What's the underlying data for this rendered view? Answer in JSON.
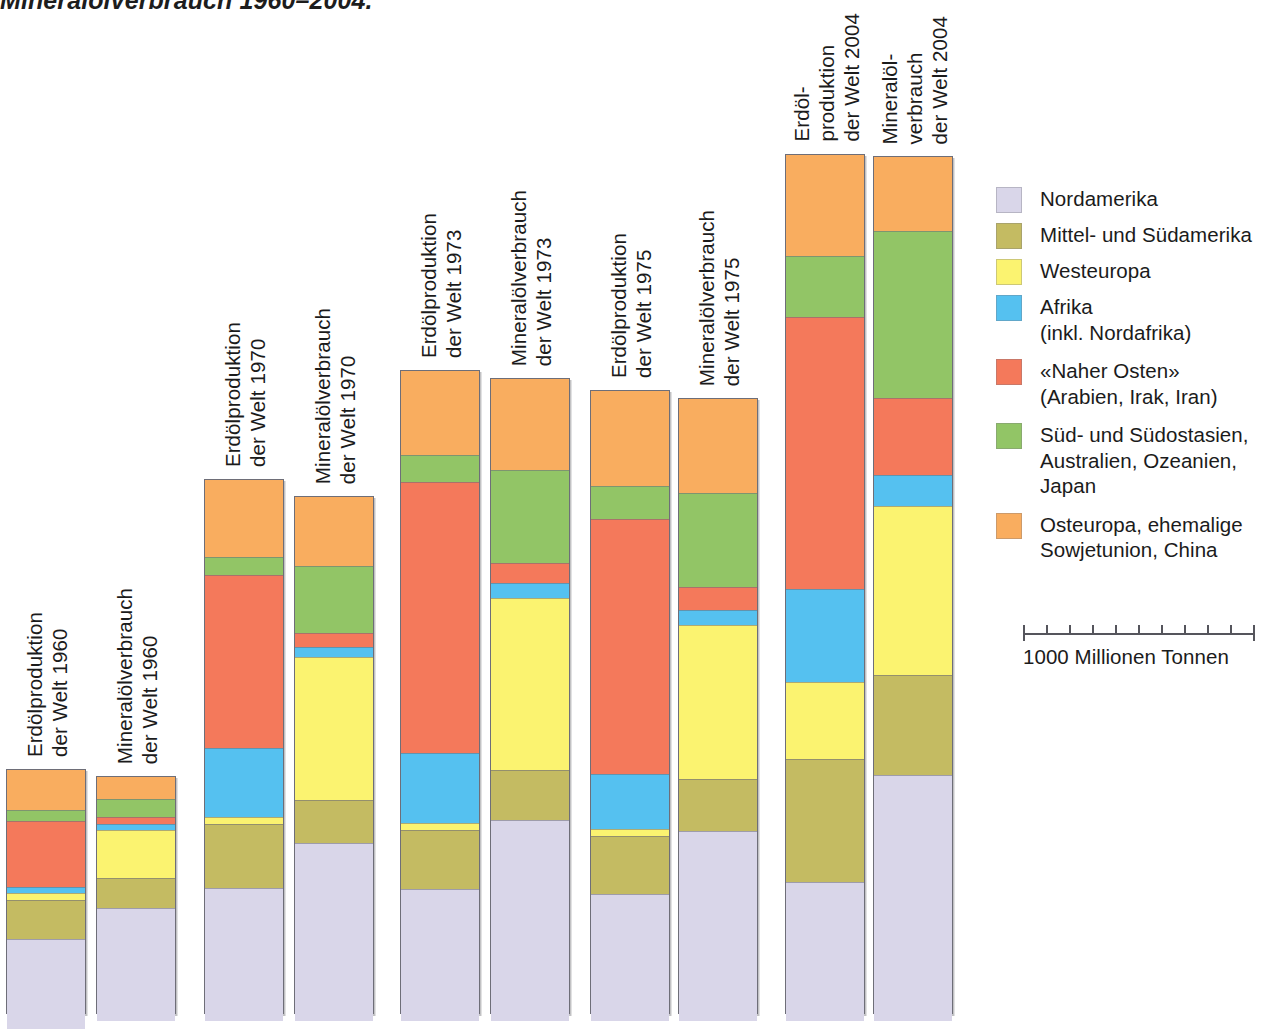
{
  "figure": {
    "title": "Mineralölverbrauch 1960–2004.",
    "title_visible_fragment": "Mineralölverbrauch 1960–2004."
  },
  "legend": {
    "items": [
      {
        "label": "Nordamerika",
        "color": "#d9d6e9",
        "key": "nordamerika"
      },
      {
        "label": "Mittel- und Südamerika",
        "color": "#c4bb62",
        "key": "mittel-suedamerika"
      },
      {
        "label": "Westeuropa",
        "color": "#fbf370",
        "key": "westeuropa"
      },
      {
        "label": "Afrika\n(inkl. Nordafrika)",
        "color": "#55c1f0",
        "key": "afrika"
      },
      {
        "label": "«Naher Osten»\n(Arabien, Irak, Iran)",
        "color": "#f4795b",
        "key": "naher-osten"
      },
      {
        "label": "Süd- und Südostasien,\nAustralien, Ozeanien,\nJapan",
        "color": "#92c566",
        "key": "suedasien"
      },
      {
        "label": "Osteuropa, ehemalige\nSowjetunion, China",
        "color": "#f9ad5f",
        "key": "osteuropa"
      }
    ]
  },
  "scale": {
    "label": "1000 Millionen Tonnen",
    "value": 1000,
    "unit": "Millionen Tonnen",
    "tick_count": 10
  },
  "chart_data": {
    "type": "bar",
    "subtype": "stacked-column",
    "xlabel": "",
    "ylabel": "Millionen Tonnen",
    "unit": "Millionen Tonnen",
    "scale_reference": {
      "pixels": 230,
      "value": 1000
    },
    "grid": false,
    "legend_position": "right",
    "series": [
      {
        "name": "Nordamerika",
        "color": "#d9d6e9"
      },
      {
        "name": "Mittel- und Südamerika",
        "color": "#c4bb62"
      },
      {
        "name": "Westeuropa",
        "color": "#fbf370"
      },
      {
        "name": "Afrika (inkl. Nordafrika)",
        "color": "#55c1f0"
      },
      {
        "name": "«Naher Osten» (Arabien, Irak, Iran)",
        "color": "#f4795b"
      },
      {
        "name": "Süd- und Südostasien, Australien, Ozeanien, Japan",
        "color": "#92c566"
      },
      {
        "name": "Osteuropa, ehemalige Sowjetunion, China",
        "color": "#f9ad5f"
      }
    ],
    "categories": [
      "Erdölproduktion der Welt 1960",
      "Mineralölverbrauch der Welt 1960",
      "Erdölproduktion der Welt 1970",
      "Mineralölverbrauch der Welt 1970",
      "Erdölproduktion der Welt 1973",
      "Mineralölverbrauch der Welt 1973",
      "Erdölproduktion der Welt 1975",
      "Mineralölverbrauch der Welt 1975",
      "Erdölproduktion der Welt 2004",
      "Mineralölverbrauch der Welt 2004"
    ],
    "bars": [
      {
        "id": "prod-1960",
        "label_lines": [
          "Erdölproduktion",
          "der Welt 1960"
        ],
        "year": 1960,
        "kind": "Erdölproduktion",
        "total": 1065,
        "values": {
          "Nordamerika": 387,
          "Mittel- und Südamerika": 165,
          "Westeuropa": 26,
          "Afrika (inkl. Nordafrika)": 22,
          "«Naher Osten» (Arabien, Irak, Iran)": 282,
          "Süd- und Südostasien, Australien, Ozeanien, Japan": 43,
          "Osteuropa, ehemalige Sowjetunion, China": 174
        }
      },
      {
        "id": "cons-1960",
        "label_lines": [
          "Mineralölverbrauch",
          "der Welt 1960"
        ],
        "year": 1960,
        "kind": "Mineralölverbrauch",
        "total": 1035,
        "values": {
          "Nordamerika": 487,
          "Mittel- und Südamerika": 126,
          "Westeuropa": 204,
          "Afrika (inkl. Nordafrika)": 22,
          "«Naher Osten» (Arabien, Irak, Iran)": 26,
          "Süd- und Südostasien, Australien, Ozeanien, Japan": 74,
          "Osteuropa, ehemalige Sowjetunion, China": 96
        }
      },
      {
        "id": "prod-1970",
        "label_lines": [
          "Erdölproduktion",
          "der Welt 1970"
        ],
        "year": 1970,
        "kind": "Erdölproduktion",
        "total": 2326,
        "values": {
          "Nordamerika": 574,
          "Mittel- und Südamerika": 274,
          "Westeuropa": 26,
          "Afrika (inkl. Nordafrika)": 296,
          "«Naher Osten» (Arabien, Irak, Iran)": 748,
          "Süd- und Südostasien, Australien, Ozeanien, Japan": 74,
          "Osteuropa, ehemalige Sowjetunion, China": 334
        }
      },
      {
        "id": "cons-1970",
        "label_lines": [
          "Mineralölverbrauch",
          "der Welt 1970"
        ],
        "year": 1970,
        "kind": "Mineralölverbrauch",
        "total": 2252,
        "values": {
          "Nordamerika": 770,
          "Mittel- und Südamerika": 183,
          "Westeuropa": 617,
          "Afrika (inkl. Nordafrika)": 39,
          "«Naher Osten» (Arabien, Irak, Iran)": 57,
          "Süd- und Südostasien, Australien, Ozeanien, Japan": 287,
          "Osteuropa, ehemalige Sowjetunion, China": 300
        }
      },
      {
        "id": "prod-1973",
        "label_lines": [
          "Erdölproduktion",
          "der Welt 1973"
        ],
        "year": 1973,
        "kind": "Erdölproduktion",
        "total": 2800,
        "values": {
          "Nordamerika": 570,
          "Mittel- und Südamerika": 252,
          "Westeuropa": 26,
          "Afrika (inkl. Nordafrika)": 300,
          "«Naher Osten» (Arabien, Irak, Iran)": 1174,
          "Süd- und Südostasien, Australien, Ozeanien, Japan": 113,
          "Osteuropa, ehemalige Sowjetunion, China": 365
        }
      },
      {
        "id": "cons-1973",
        "label_lines": [
          "Mineralölverbrauch",
          "der Welt 1973"
        ],
        "year": 1973,
        "kind": "Mineralölverbrauch",
        "total": 2765,
        "values": {
          "Nordamerika": 870,
          "Mittel- und Südamerika": 213,
          "Westeuropa": 743,
          "Afrika (inkl. Nordafrika)": 61,
          "«Naher Osten» (Arabien, Irak, Iran)": 83,
          "Süd- und Südostasien, Australien, Ozeanien, Japan": 400,
          "Osteuropa, ehemalige Sowjetunion, China": 395
        }
      },
      {
        "id": "prod-1975",
        "label_lines": [
          "Erdölproduktion",
          "der Welt 1975"
        ],
        "year": 1975,
        "kind": "Erdölproduktion",
        "total": 2713,
        "values": {
          "Nordamerika": 548,
          "Mittel- und Südamerika": 248,
          "Westeuropa": 26,
          "Afrika (inkl. Nordafrika)": 235,
          "«Naher Osten» (Arabien, Irak, Iran)": 1104,
          "Süd- und Südostasien, Australien, Ozeanien, Japan": 139,
          "Osteuropa, ehemalige Sowjetunion, China": 413
        }
      },
      {
        "id": "cons-1975",
        "label_lines": [
          "Mineralölverbrauch",
          "der Welt 1975"
        ],
        "year": 1975,
        "kind": "Mineralölverbrauch",
        "total": 2678,
        "values": {
          "Nordamerika": 822,
          "Mittel- und Südamerika": 222,
          "Westeuropa": 665,
          "Afrika (inkl. Nordafrika)": 61,
          "«Naher Osten» (Arabien, Irak, Iran)": 96,
          "Süd- und Südostasien, Australien, Ozeanien, Japan": 404,
          "Osteuropa, ehemalige Sowjetunion, China": 408
        }
      },
      {
        "id": "prod-2004",
        "label_lines": [
          "Erdöl-",
          "produktion",
          "der Welt 2004"
        ],
        "year": 2004,
        "kind": "Erdölproduktion",
        "total": 3740,
        "values": {
          "Nordamerika": 600,
          "Mittel- und Südamerika": 530,
          "Westeuropa": 330,
          "Afrika (inkl. Nordafrika)": 400,
          "«Naher Osten» (Arabien, Irak, Iran)": 1180,
          "Süd- und Südostasien, Australien, Ozeanien, Japan": 260,
          "Osteuropa, ehemalige Sowjetunion, China": 440
        }
      },
      {
        "id": "cons-2004",
        "label_lines": [
          "Mineralöl-",
          "verbrauch",
          "der Welt 2004"
        ],
        "year": 2004,
        "kind": "Mineralölverbrauch",
        "total": 3730,
        "values": {
          "Nordamerika": 1065,
          "Mittel- und Südamerika": 430,
          "Westeuropa": 730,
          "Afrika (inkl. Nordafrika)": 130,
          "«Naher Osten» (Arabien, Irak, Iran)": 330,
          "Süd- und Südostasien, Australien, Ozeanien, Japan": 725,
          "Osteuropa, ehemalige Sowjetunion, China": 320
        }
      }
    ]
  },
  "layout": {
    "bar_width": 80,
    "bar_lefts": [
      6,
      96,
      204,
      294,
      400,
      490,
      590,
      678,
      785,
      873
    ],
    "bar_bottom": 1014,
    "px_per_unit": 0.23
  }
}
